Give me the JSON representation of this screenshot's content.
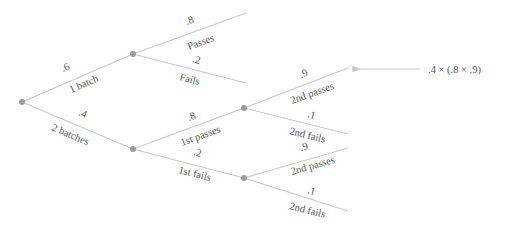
{
  "diagram": {
    "type": "probability-tree",
    "colors": {
      "line": "#c8c8c8",
      "node": "#9a9a9a",
      "text": "#555555"
    },
    "level1": {
      "upper": {
        "prob": ".6",
        "label": "1 batch"
      },
      "lower": {
        "prob": ".4",
        "label": "2 batches"
      }
    },
    "one_batch": {
      "upper": {
        "prob": ".8",
        "label": "Passes"
      },
      "lower": {
        "prob": ".2",
        "label": "Fails"
      }
    },
    "two_batches": {
      "upper": {
        "prob": ".8",
        "label": "1st passes"
      },
      "lower": {
        "prob": ".2",
        "label": "1st fails"
      }
    },
    "first_passes": {
      "upper": {
        "prob": ".9",
        "label": "2nd passes"
      },
      "lower": {
        "prob": ".1",
        "label": "2nd fails"
      }
    },
    "first_fails": {
      "upper": {
        "prob": ".9",
        "label": "2nd passes"
      },
      "lower": {
        "prob": ".1",
        "label": "2nd fails"
      }
    },
    "annotation": ".4 × (.8 × .9)"
  }
}
